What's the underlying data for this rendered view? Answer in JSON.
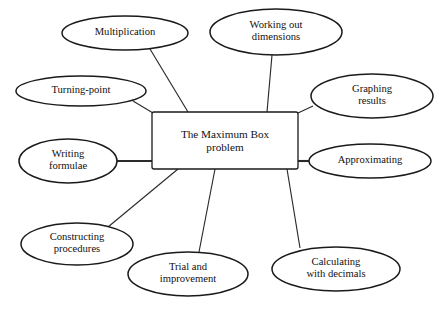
{
  "diagram": {
    "type": "mind-map",
    "background_color": "#ffffff",
    "stroke_color": "#1a1a1a",
    "connector_color": "#2b2b2b",
    "text_color": "#111111",
    "central_node": {
      "id": "central-node",
      "shape": "rectangle",
      "line1": "The Maximum Box",
      "line2": "problem",
      "x": 152,
      "y": 112,
      "width": 146,
      "height": 57
    },
    "branches": [
      {
        "id": "multiplication",
        "shape": "ellipse",
        "line1": "Multiplication",
        "line2": "",
        "cx": 125,
        "cy": 33,
        "rx": 63,
        "ry": 17,
        "connector": {
          "x1": 150,
          "y1": 49,
          "x2": 188,
          "y2": 112
        }
      },
      {
        "id": "working-out-dimensions",
        "shape": "ellipse",
        "line1": "Working out",
        "line2": "dimensions",
        "cx": 276,
        "cy": 32,
        "rx": 66,
        "ry": 23,
        "connector": {
          "x1": 272,
          "y1": 55,
          "x2": 267,
          "y2": 112
        }
      },
      {
        "id": "turning-point",
        "shape": "ellipse",
        "line1": "Turning-point",
        "line2": "",
        "cx": 81,
        "cy": 91,
        "rx": 65,
        "ry": 15,
        "connector": {
          "x1": 133,
          "y1": 101,
          "x2": 153,
          "y2": 113
        }
      },
      {
        "id": "graphing-results",
        "shape": "ellipse",
        "line1": "Graphing",
        "line2": "results",
        "cx": 372,
        "cy": 96,
        "rx": 61,
        "ry": 22,
        "connector": {
          "x1": 313,
          "y1": 106,
          "x2": 298,
          "y2": 113
        }
      },
      {
        "id": "writing-formulae",
        "shape": "ellipse",
        "line1": "Writing",
        "line2": "formulae",
        "cx": 68,
        "cy": 161,
        "rx": 49,
        "ry": 22,
        "connector": {
          "x1": 117,
          "y1": 161,
          "x2": 152,
          "y2": 161
        }
      },
      {
        "id": "approximating",
        "shape": "ellipse",
        "line1": "Approximating",
        "line2": "",
        "cx": 370,
        "cy": 161,
        "rx": 61,
        "ry": 17,
        "connector": {
          "x1": 309,
          "y1": 161,
          "x2": 298,
          "y2": 161
        }
      },
      {
        "id": "constructing-procedures",
        "shape": "ellipse",
        "line1": "Constructing",
        "line2": "procedures",
        "cx": 77,
        "cy": 244,
        "rx": 56,
        "ry": 21,
        "connector": {
          "x1": 108,
          "y1": 227,
          "x2": 178,
          "y2": 169
        }
      },
      {
        "id": "trial-and-improvement",
        "shape": "ellipse",
        "line1": "Trial and",
        "line2": "improvement",
        "cx": 188,
        "cy": 274,
        "rx": 60,
        "ry": 22,
        "connector": {
          "x1": 199,
          "y1": 252,
          "x2": 215,
          "y2": 169
        }
      },
      {
        "id": "calculating-with-decimals",
        "shape": "ellipse",
        "line1": "Calculating",
        "line2": "with decimals",
        "cx": 336,
        "cy": 269,
        "rx": 64,
        "ry": 22,
        "connector": {
          "x1": 300,
          "y1": 248,
          "x2": 287,
          "y2": 169
        }
      }
    ]
  }
}
